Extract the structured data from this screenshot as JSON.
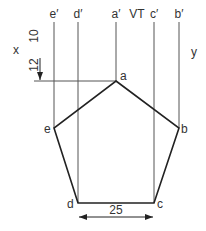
{
  "diagram": {
    "labels": {
      "top": [
        "e′",
        "d′",
        "a′",
        "VT",
        "c′",
        "b′"
      ],
      "x": "x",
      "y": "y",
      "dim_10": "10",
      "dim_12": "12",
      "dim_25": "25",
      "vertices": {
        "a": "a",
        "b": "b",
        "c": "c",
        "d": "d",
        "e": "e"
      }
    },
    "colors": {
      "line": "#333333",
      "thin": "#555555"
    }
  }
}
